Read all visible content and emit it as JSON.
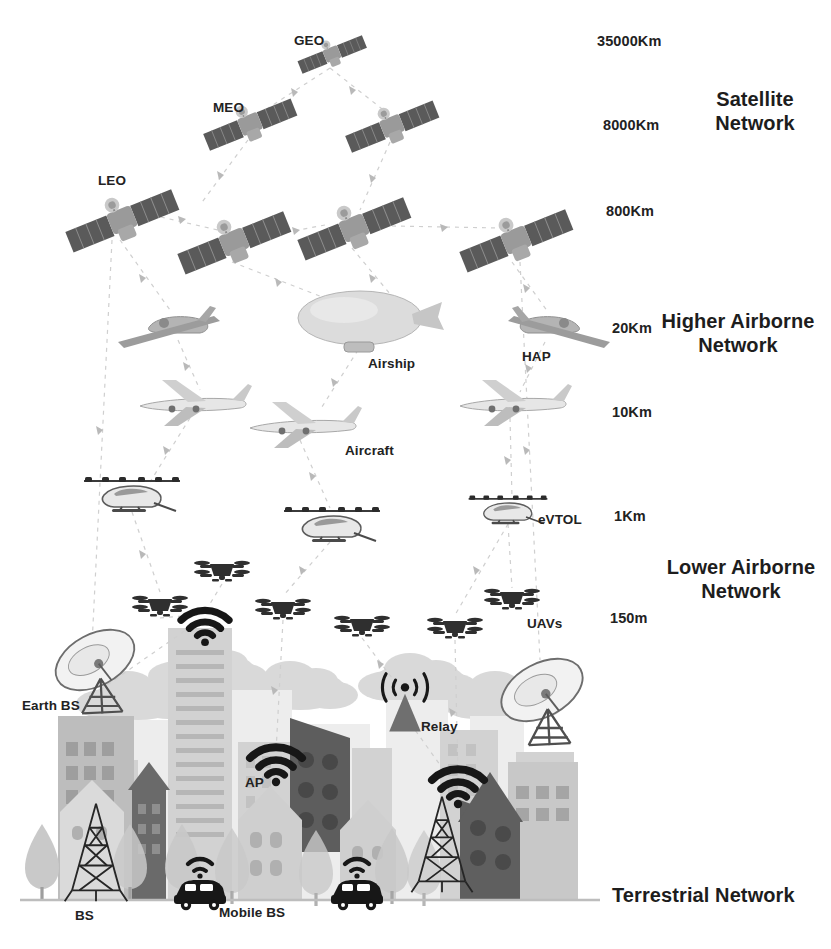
{
  "figure": {
    "kind": "space-air-ground integrated network architecture",
    "background_color": "#ffffff",
    "text_color": "#222222"
  },
  "altitude_labels": [
    {
      "text": "35000Km",
      "x": 597,
      "y": 33
    },
    {
      "text": "8000Km",
      "x": 603,
      "y": 117
    },
    {
      "text": "800Km",
      "x": 606,
      "y": 203
    },
    {
      "text": "20Km",
      "x": 612,
      "y": 320
    },
    {
      "text": "10Km",
      "x": 612,
      "y": 404
    },
    {
      "text": "1Km",
      "x": 614,
      "y": 508
    },
    {
      "text": "150m",
      "x": 610,
      "y": 610
    }
  ],
  "tier_labels": [
    {
      "id": "satellite-network",
      "line1": "Satellite",
      "line2": "Network",
      "x": 690,
      "y": 88,
      "align": "center"
    },
    {
      "id": "higher-airborne-network",
      "line1": "Higher Airborne",
      "line2": "Network",
      "x": 655,
      "y": 310,
      "align": "center"
    },
    {
      "id": "lower-airborne-network",
      "line1": "Lower Airborne",
      "line2": "Network",
      "x": 662,
      "y": 556,
      "align": "center"
    },
    {
      "id": "terrestrial-network",
      "line1": "Terrestrial Network",
      "line2": "",
      "x": 612,
      "y": 884,
      "align": "left"
    }
  ],
  "node_labels": [
    {
      "id": "geo",
      "text": "GEO",
      "x": 294,
      "y": 33
    },
    {
      "id": "meo",
      "text": "MEO",
      "x": 213,
      "y": 100
    },
    {
      "id": "leo",
      "text": "LEO",
      "x": 98,
      "y": 173
    },
    {
      "id": "airship",
      "text": "Airship",
      "x": 368,
      "y": 356
    },
    {
      "id": "hap",
      "text": "HAP",
      "x": 522,
      "y": 349
    },
    {
      "id": "aircraft",
      "text": "Aircraft",
      "x": 345,
      "y": 443
    },
    {
      "id": "evtol",
      "text": "eVTOL",
      "x": 538,
      "y": 512
    },
    {
      "id": "uavs",
      "text": "UAVs",
      "x": 527,
      "y": 616
    },
    {
      "id": "earth-bs",
      "text": "Earth BS",
      "x": 22,
      "y": 698
    },
    {
      "id": "ap",
      "text": "AP",
      "x": 245,
      "y": 775
    },
    {
      "id": "relay",
      "text": "Relay",
      "x": 421,
      "y": 719
    },
    {
      "id": "bs",
      "text": "BS",
      "x": 75,
      "y": 908
    },
    {
      "id": "mobile-bs",
      "text": "Mobile BS",
      "x": 219,
      "y": 905
    }
  ],
  "layers": {
    "satellites": {
      "geo": [
        {
          "x": 330,
          "y": 52,
          "scale": 1.0,
          "rot": -22
        }
      ],
      "meo": [
        {
          "x": 248,
          "y": 122,
          "scale": 1.25,
          "rot": -24
        },
        {
          "x": 390,
          "y": 124,
          "scale": 1.25,
          "rot": -24
        }
      ],
      "leo": [
        {
          "x": 120,
          "y": 219,
          "scale": 1.45,
          "rot": -25
        },
        {
          "x": 232,
          "y": 241,
          "scale": 1.45,
          "rot": -25
        },
        {
          "x": 352,
          "y": 226,
          "scale": 1.45,
          "rot": -25
        },
        {
          "x": 512,
          "y": 240,
          "scale": 1.45,
          "rot": -25
        }
      ]
    },
    "higher_airborne": {
      "hap": [
        {
          "x": 178,
          "y": 324,
          "scale": 1.0,
          "flip": false
        },
        {
          "x": 545,
          "y": 324,
          "scale": 1.0,
          "flip": true
        }
      ],
      "airship": [
        {
          "x": 358,
          "y": 320,
          "scale": 1.0
        }
      ],
      "aircraft": [
        {
          "x": 190,
          "y": 404,
          "scale": 1.0
        },
        {
          "x": 300,
          "y": 425,
          "scale": 1.0
        },
        {
          "x": 510,
          "y": 404,
          "scale": 1.0
        }
      ]
    },
    "lower_airborne": {
      "evtol": [
        {
          "x": 132,
          "y": 495,
          "scale": 1.0
        },
        {
          "x": 330,
          "y": 525,
          "scale": 1.0
        },
        {
          "x": 508,
          "y": 510,
          "scale": 0.85
        }
      ],
      "uavs": [
        {
          "x": 222,
          "y": 570,
          "scale": 1.0
        },
        {
          "x": 160,
          "y": 605,
          "scale": 1.0
        },
        {
          "x": 283,
          "y": 608,
          "scale": 1.0
        },
        {
          "x": 362,
          "y": 625,
          "scale": 1.0
        },
        {
          "x": 455,
          "y": 627,
          "scale": 1.0
        },
        {
          "x": 512,
          "y": 598,
          "scale": 1.0
        }
      ]
    },
    "terrestrial": {
      "earth_station_dishes": [
        {
          "x": 85,
          "y": 660
        },
        {
          "x": 540,
          "y": 690
        }
      ],
      "wifi_aps": [
        {
          "x": 205,
          "y": 625,
          "size": 1.0
        },
        {
          "x": 275,
          "y": 765,
          "size": 1.1
        },
        {
          "x": 458,
          "y": 790,
          "size": 1.1
        }
      ],
      "relay_tower": [
        {
          "x": 405,
          "y": 705
        }
      ],
      "bs_towers": [
        {
          "x": 95,
          "y": 855
        },
        {
          "x": 440,
          "y": 840
        }
      ],
      "mobile_bs_cars": [
        {
          "x": 200,
          "y": 900
        },
        {
          "x": 355,
          "y": 900
        }
      ]
    }
  },
  "palette": {
    "satellite_body": "#8f8f8f",
    "satellite_panel": "#5a5a5a",
    "aircraft": "#bdbdbd",
    "drone": "#3c3c3c",
    "building_light": "#e3e3e3",
    "building_mid": "#c4c4c4",
    "building_dark": "#8b8b8b",
    "building_darkest": "#6e6e6e",
    "cloud": "#d8d8d8",
    "tree_light": "#d4d4d4",
    "tree_mid": "#b0b0b0",
    "link": "#c9c9c9",
    "icon_black": "#171717"
  }
}
